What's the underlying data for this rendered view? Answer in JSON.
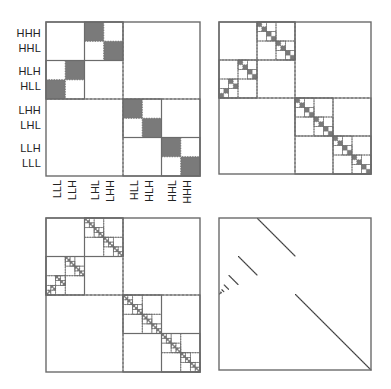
{
  "figure": {
    "colors": {
      "border": "#6b6b6b",
      "dashed": "#707070",
      "cell_fill": "#7a7a7a",
      "dot": "#3a3a3a",
      "background": "#ffffff"
    },
    "rules": {
      "R": [
        [
          "TL",
          "A"
        ],
        [
          "BR",
          "D"
        ]
      ],
      "A": [
        [
          "TR",
          "D"
        ],
        [
          "BL",
          "A"
        ]
      ],
      "D": [
        [
          "TL",
          "D"
        ],
        [
          "BR",
          "D"
        ]
      ]
    },
    "root_mode": "R"
  },
  "panels": [
    {
      "id": "panel-depth-3",
      "x": 46,
      "y": 22,
      "size": 154,
      "depth": 3,
      "style": "grid",
      "show_labels": true
    },
    {
      "id": "panel-depth-5",
      "x": 219,
      "y": 22,
      "size": 152,
      "depth": 5,
      "style": "grid",
      "show_labels": false
    },
    {
      "id": "panel-depth-6",
      "x": 46,
      "y": 218,
      "size": 154,
      "depth": 6,
      "style": "grid",
      "show_labels": false
    },
    {
      "id": "panel-depth-8",
      "x": 219,
      "y": 218,
      "size": 152,
      "depth": 8,
      "style": "dots",
      "show_labels": false
    }
  ],
  "row_labels": [
    "HHH",
    "HHL",
    "HLH",
    "HLL",
    "LHH",
    "LHL",
    "LLH",
    "LLL"
  ],
  "col_labels": [
    "LLL",
    "LLH",
    "LHL",
    "LHH",
    "HLL",
    "HLH",
    "HHL",
    "HHH"
  ]
}
